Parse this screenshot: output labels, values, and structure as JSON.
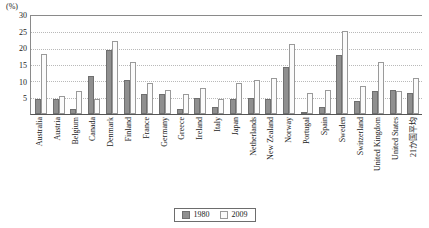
{
  "chart_data": {
    "type": "bar",
    "title": "",
    "subtitle": "",
    "unit_label": "(%)",
    "xlabel": "",
    "ylabel": "",
    "ylim": [
      0,
      30
    ],
    "ytick_step": 5,
    "yticks": [
      30,
      25,
      20,
      15,
      10,
      5
    ],
    "grid": true,
    "legend_position": "bottom-center",
    "categories": [
      "Australia",
      "Austria",
      "Belgium",
      "Canada",
      "Denmark",
      "Finland",
      "France",
      "Germany",
      "Greece",
      "Ireland",
      "Italy",
      "Japan",
      "Netherlands",
      "New Zealand",
      "Norway",
      "Portugal",
      "Spain",
      "Sweden",
      "Switzerland",
      "United Kingdom",
      "United States",
      "21か国平均"
    ],
    "series": [
      {
        "name": "1980",
        "color": "#8f8f8f",
        "values": [
          4.5,
          4.5,
          1.5,
          11.5,
          19.5,
          10.5,
          6.0,
          6.0,
          1.5,
          5.0,
          2.0,
          4.5,
          5.0,
          4.5,
          14.5,
          0.5,
          2.0,
          18.0,
          4.0,
          7.0,
          7.5,
          6.5
        ]
      },
      {
        "name": "2009",
        "color": "#fbfbfb",
        "values": [
          18.5,
          5.5,
          7.0,
          4.5,
          22.5,
          16.0,
          9.5,
          7.5,
          6.0,
          8.0,
          4.5,
          9.5,
          10.5,
          11.0,
          21.5,
          6.5,
          7.5,
          25.5,
          8.5,
          16.0,
          7.0,
          11.0
        ]
      }
    ]
  },
  "legend": {
    "items": [
      {
        "label": "1980"
      },
      {
        "label": "2009"
      }
    ]
  }
}
